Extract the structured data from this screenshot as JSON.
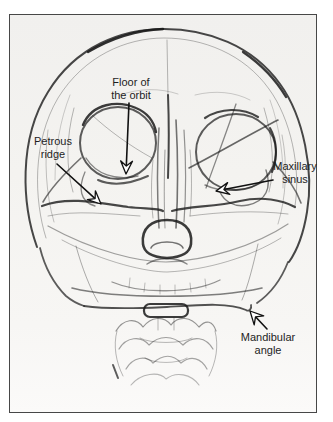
{
  "colors": {
    "ink": "#1c1c1c",
    "paper": "#f4f3f0",
    "frame_border": "#474747",
    "label_text": "#1e1e1e",
    "arrowhead_fill": "#ffffff"
  },
  "annotations": {
    "floor_of_orbit": {
      "line1": "Floor of",
      "line2": "the orbit"
    },
    "petrous_ridge": {
      "line1": "Petrous",
      "line2": "ridge"
    },
    "maxillary_sinus": {
      "line1": "Maxillary",
      "line2": "sinus"
    },
    "mandibular_angle": {
      "line1": "Mandibular",
      "line2": "angle"
    }
  }
}
